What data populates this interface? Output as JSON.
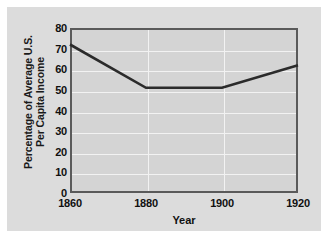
{
  "chart_data": {
    "type": "line",
    "title": "",
    "xlabel": "Year",
    "ylabel_line1": "Percentage of Average U.S.",
    "ylabel_line2": "Per Capita Income",
    "x": [
      1860,
      1880,
      1900,
      1920
    ],
    "values": [
      72,
      51,
      51,
      62
    ],
    "series": [
      {
        "name": "Percentage of Average U.S. Per Capita Income",
        "values": [
          72,
          51,
          51,
          62
        ]
      }
    ],
    "xtick_labels": [
      "1860",
      "1880",
      "1900",
      "1920"
    ],
    "ytick_labels": [
      "0",
      "10",
      "20",
      "30",
      "40",
      "50",
      "60",
      "70",
      "80"
    ],
    "ytick_values": [
      0,
      10,
      20,
      30,
      40,
      50,
      60,
      70,
      80
    ],
    "xlim": [
      1860,
      1920
    ],
    "ylim": [
      0,
      80
    ],
    "grid": "horizontal-and-vertical",
    "legend": "none",
    "line_color": "#2b2b2b",
    "plot_background": "#d4d4d4",
    "figure_background": "#dcdcdc",
    "gridline_color": "#f2f2f2",
    "frame_color": "#5a5a5a"
  }
}
